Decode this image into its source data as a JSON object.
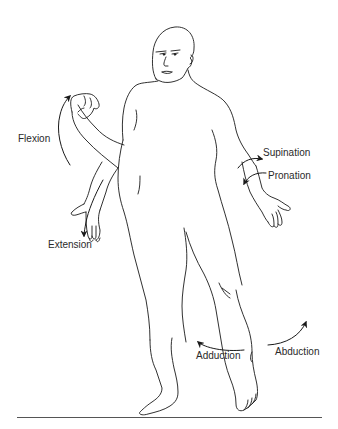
{
  "diagram": {
    "line_color": "#1a1a1a",
    "text_color": "#2a2a2a",
    "labels": {
      "flexion": "Flexion",
      "extension": "Extension",
      "supination": "Supination",
      "pronation": "Pronation",
      "adduction": "Adduction",
      "abduction": "Abduction"
    },
    "arrows": [
      {
        "name": "flexion-arrow",
        "direction": "up",
        "location": "left elbow"
      },
      {
        "name": "extension-arrow",
        "direction": "down",
        "location": "left elbow"
      },
      {
        "name": "supination-arrow",
        "direction": "right",
        "location": "right forearm"
      },
      {
        "name": "pronation-arrow",
        "direction": "down-left",
        "location": "right forearm"
      },
      {
        "name": "adduction-arrow",
        "direction": "left",
        "location": "legs"
      },
      {
        "name": "abduction-arrow",
        "direction": "up-right",
        "location": "right leg"
      }
    ]
  }
}
